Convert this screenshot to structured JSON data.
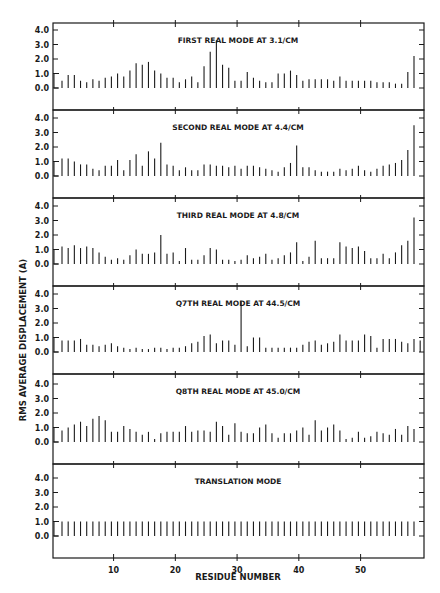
{
  "chart_data": {
    "type": "bar",
    "xlabel": "RESIDUE NUMBER",
    "ylabel": "RMS AVERAGE DISPLACEMENT (A)",
    "x_ticks": [
      10,
      20,
      30,
      40,
      50
    ],
    "x_range": [
      0,
      59
    ],
    "y_ticks": [
      "0.0",
      "1.0",
      "2.0",
      "3.0",
      "4.0"
    ],
    "ylim": [
      -1.0,
      5.0
    ],
    "grid": false,
    "panels": [
      {
        "title": "FIRST REAL MODE AT 3.1/CM",
        "values": [
          0.5,
          0.9,
          0.9,
          0.5,
          0.4,
          0.6,
          0.5,
          0.7,
          0.8,
          1.0,
          0.8,
          1.2,
          1.7,
          1.6,
          1.8,
          1.2,
          1.0,
          0.7,
          0.7,
          0.4,
          0.6,
          0.8,
          0.4,
          1.5,
          2.5,
          3.3,
          1.6,
          1.4,
          0.5,
          0.5,
          1.1,
          0.7,
          0.5,
          0.4,
          0.4,
          1.0,
          1.0,
          1.2,
          0.9,
          0.5,
          0.6,
          0.6,
          0.6,
          0.6,
          0.5,
          0.8,
          0.5,
          0.5,
          0.5,
          0.5,
          0.5,
          0.4,
          0.4,
          0.4,
          0.3,
          0.3,
          1.1,
          2.2
        ]
      },
      {
        "title": "SECOND REAL MODE AT 4.4/CM",
        "values": [
          1.2,
          1.2,
          1.0,
          0.8,
          0.8,
          0.5,
          0.4,
          0.7,
          0.7,
          1.1,
          0.4,
          1.1,
          1.5,
          0.7,
          1.7,
          1.2,
          2.3,
          0.8,
          0.7,
          0.4,
          0.6,
          0.4,
          0.4,
          0.8,
          0.8,
          0.7,
          0.7,
          0.6,
          0.7,
          0.5,
          0.7,
          0.7,
          0.6,
          0.5,
          0.4,
          0.3,
          0.6,
          0.9,
          2.1,
          0.6,
          0.6,
          0.4,
          0.3,
          0.3,
          0.3,
          0.5,
          0.4,
          0.5,
          0.7,
          0.4,
          0.3,
          0.5,
          0.7,
          0.8,
          0.9,
          1.1,
          1.8,
          3.5
        ]
      },
      {
        "title": "THIRD REAL MODE AT 4.8/CM",
        "values": [
          1.2,
          1.1,
          1.3,
          1.1,
          1.2,
          1.1,
          0.8,
          0.5,
          0.3,
          0.4,
          0.3,
          0.6,
          1.0,
          0.7,
          0.7,
          0.8,
          2.0,
          0.7,
          0.8,
          0.2,
          1.1,
          0.3,
          0.3,
          0.6,
          1.1,
          1.0,
          0.3,
          0.3,
          0.2,
          0.3,
          0.6,
          0.4,
          0.5,
          0.7,
          0.3,
          0.4,
          0.6,
          0.8,
          1.5,
          0.2,
          0.5,
          1.6,
          0.4,
          0.4,
          0.4,
          1.5,
          1.2,
          1.1,
          1.2,
          0.9,
          0.4,
          0.4,
          0.7,
          0.4,
          0.8,
          1.3,
          1.6,
          3.2
        ]
      },
      {
        "title": "Q7TH REAL MODE AT 44.5/CM",
        "values": [
          0.8,
          0.8,
          0.8,
          0.9,
          0.5,
          0.5,
          0.4,
          0.5,
          0.6,
          0.4,
          0.3,
          0.2,
          0.3,
          0.2,
          0.2,
          0.3,
          0.3,
          0.2,
          0.3,
          0.3,
          0.4,
          0.6,
          0.7,
          1.1,
          1.2,
          0.6,
          0.8,
          0.8,
          0.5,
          3.5,
          0.4,
          1.0,
          1.0,
          0.3,
          0.3,
          0.3,
          0.3,
          0.3,
          0.3,
          0.5,
          0.7,
          0.8,
          0.5,
          0.6,
          0.7,
          1.2,
          0.8,
          0.8,
          0.8,
          1.2,
          1.1,
          0.3,
          0.9,
          0.9,
          0.9,
          0.7,
          0.6,
          0.9,
          0.8
        ]
      },
      {
        "title": "Q8TH REAL MODE AT 45.0/CM",
        "values": [
          0.8,
          1.0,
          1.2,
          1.4,
          1.1,
          1.6,
          1.8,
          1.5,
          0.7,
          0.7,
          1.1,
          0.9,
          0.7,
          0.5,
          0.7,
          0.2,
          0.6,
          0.7,
          0.7,
          0.7,
          1.1,
          0.7,
          0.8,
          0.8,
          0.7,
          1.4,
          1.1,
          0.5,
          1.3,
          0.7,
          0.6,
          0.6,
          1.0,
          1.2,
          0.6,
          0.3,
          0.6,
          0.6,
          0.8,
          1.0,
          0.5,
          1.5,
          0.8,
          1.0,
          1.2,
          0.8,
          0.2,
          0.3,
          0.7,
          0.3,
          0.4,
          0.7,
          0.6,
          0.5,
          0.9,
          0.5,
          1.1,
          0.9
        ]
      },
      {
        "title": "TRANSLATION MODE",
        "values": [
          1.0,
          1.0,
          1.0,
          1.0,
          1.0,
          1.0,
          1.0,
          1.0,
          1.0,
          1.0,
          1.0,
          1.0,
          1.0,
          1.0,
          1.0,
          1.0,
          1.0,
          1.0,
          1.0,
          1.0,
          1.0,
          1.0,
          1.0,
          1.0,
          1.0,
          1.0,
          1.0,
          1.0,
          1.0,
          1.0,
          1.0,
          1.0,
          1.0,
          1.0,
          1.0,
          1.0,
          1.0,
          1.0,
          1.0,
          1.0,
          1.0,
          1.0,
          1.0,
          1.0,
          1.0,
          1.0,
          1.0,
          1.0,
          1.0,
          1.0,
          1.0,
          1.0,
          1.0,
          1.0,
          1.0,
          1.0,
          1.0,
          1.0
        ]
      }
    ]
  }
}
